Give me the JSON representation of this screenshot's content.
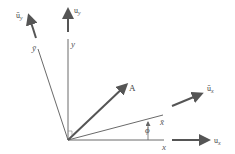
{
  "diagram": {
    "title": "",
    "colors": {
      "axis": "#6a6a6a",
      "vector": "#555555",
      "text": "#555555"
    },
    "labels": {
      "x": "x",
      "y": "y",
      "x_bar": "x̄",
      "y_bar": "ȳ",
      "u_x": "u",
      "u_x_sub": "x",
      "u_y": "u",
      "u_y_sub": "y",
      "ubar_x": "ū",
      "ubar_x_sub": "x",
      "ubar_y": "ū",
      "ubar_y_sub": "y",
      "A": "A",
      "phi": "ϕ"
    },
    "elements": [
      {
        "id": "x-axis",
        "type": "line",
        "label": "x"
      },
      {
        "id": "y-axis",
        "type": "line",
        "label": "y"
      },
      {
        "id": "x-bar-axis",
        "type": "line",
        "label": "x̄"
      },
      {
        "id": "y-bar-axis",
        "type": "line",
        "label": "ȳ"
      },
      {
        "id": "unit-vector-ux",
        "type": "arrow",
        "label": "u_x"
      },
      {
        "id": "unit-vector-uy",
        "type": "arrow",
        "label": "u_y"
      },
      {
        "id": "unit-vector-ubar-x",
        "type": "arrow",
        "label": "ū_x"
      },
      {
        "id": "unit-vector-ubar-y",
        "type": "arrow",
        "label": "ū_y"
      },
      {
        "id": "vector-A",
        "type": "arrow",
        "label": "A"
      },
      {
        "id": "angle-phi",
        "type": "angle",
        "label": "ϕ"
      }
    ]
  }
}
